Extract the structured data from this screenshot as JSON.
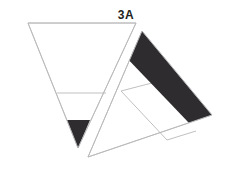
{
  "figure": {
    "label": "3A",
    "background_color": "#ffffff",
    "stroke_color": "#b9b9bb",
    "fill_dark": "#2e2c2e",
    "fill_light": "#ffffff",
    "label_color": "#231f20",
    "canvas": {
      "width": 234,
      "height": 170
    }
  },
  "shapes": {
    "inverted_triangle": {
      "name": "inverted-triangle",
      "points": "28,23 136,23 78,148",
      "fill": "#ffffff",
      "stroke": "#b9b9bb"
    },
    "inverted_triangle_divider": {
      "name": "inverted-triangle-divider",
      "x1": 57,
      "y1": 93,
      "x2": 106,
      "y2": 93,
      "stroke": "#b9b9bb"
    },
    "inverted_triangle_tip": {
      "name": "inverted-triangle-dark-tip",
      "points": "67,120 90,120 78,148",
      "fill": "#2e2c2e"
    },
    "right_triangle": {
      "name": "right-triangle",
      "points": "142,31 212,115 88,157",
      "fill": "#ffffff",
      "stroke": "#b9b9bb"
    },
    "right_triangle_band": {
      "name": "right-triangle-dark-band",
      "points": "142,31 212,115 189,123 123,54",
      "fill": "#2e2c2e"
    },
    "right_triangle_inner_a": {
      "name": "right-triangle-inner-line-a",
      "x1": 121,
      "y1": 91,
      "x2": 167,
      "y2": 140,
      "stroke": "#b9b9bb"
    },
    "right_triangle_inner_b": {
      "name": "right-triangle-inner-line-b",
      "x1": 121,
      "y1": 91,
      "x2": 175,
      "y2": 77,
      "stroke": "#b9b9bb"
    },
    "right_triangle_inner_c": {
      "name": "right-triangle-inner-line-c",
      "x1": 167,
      "y1": 140,
      "x2": 196,
      "y2": 131,
      "stroke": "#b9b9bb"
    }
  }
}
